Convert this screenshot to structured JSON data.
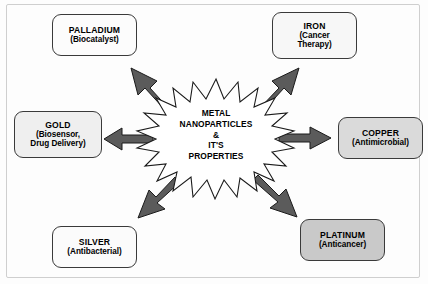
{
  "diagram": {
    "title": "METAL NANOPARTICLES & IT'S PROPERTIES",
    "center": {
      "line1": "METAL",
      "line2": "NANOPARTICLES",
      "line3": "&",
      "line4": "IT'S",
      "line5": "PROPERTIES",
      "shape": "starburst",
      "points": 24,
      "fill": "#ffffff",
      "stroke": "#1a1a1a"
    },
    "arrow_color": "#5b5b5b",
    "arrow_stroke": "#1a1a1a",
    "nodes": [
      {
        "id": "palladium",
        "name": "PALLADIUM",
        "property": "(Biocatalyst)",
        "fill": "#fcfcfc",
        "direction": "up-left"
      },
      {
        "id": "iron",
        "name": "IRON",
        "property": "(Cancer",
        "property2": "Therapy)",
        "fill": "#f7f7f7",
        "direction": "up-right"
      },
      {
        "id": "gold",
        "name": "GOLD",
        "property": "(Biosensor,",
        "property2": "Drug Delivery)",
        "fill": "#efefef",
        "direction": "left"
      },
      {
        "id": "copper",
        "name": "COPPER",
        "property": "(Antimicrobial)",
        "fill": "#dadada",
        "direction": "right"
      },
      {
        "id": "silver",
        "name": "SILVER",
        "property": "(Antibacterial)",
        "fill": "#fbfbfb",
        "direction": "down-left"
      },
      {
        "id": "platinum",
        "name": "PLATINUM",
        "property": "(Anticancer)",
        "fill": "#c9c9c9",
        "direction": "down-right"
      }
    ]
  }
}
